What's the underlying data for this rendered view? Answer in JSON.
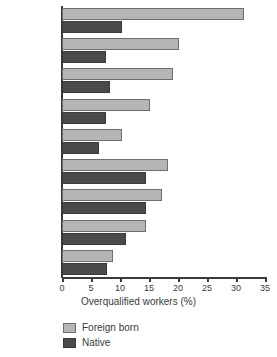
{
  "chart_data": {
    "type": "bar",
    "orientation": "horizontal",
    "title": "",
    "xlabel": "Overqualified workers (%)",
    "ylabel": "",
    "xlim": [
      0,
      35
    ],
    "xticks": [
      0,
      5,
      10,
      15,
      20,
      25,
      30,
      35
    ],
    "xtick_labels": [
      "0",
      "5",
      "10",
      "15",
      "20",
      "25",
      "30",
      "35"
    ],
    "grid": false,
    "legend_position": "bottom-left",
    "categories": [
      "Greece",
      "Spain",
      "Sweden",
      "Italy",
      "Czech Rep.",
      "UK",
      "USA",
      "France",
      "Poland"
    ],
    "series": [
      {
        "name": "Foreign born",
        "color": "#b5b5b5",
        "values": [
          31.4,
          20.1,
          19.2,
          15.2,
          10.4,
          18.2,
          17.2,
          14.4,
          8.8
        ]
      },
      {
        "name": "Native",
        "color": "#4a4a4a",
        "values": [
          10.4,
          7.5,
          8.3,
          7.6,
          6.4,
          14.4,
          14.4,
          11.1,
          7.8
        ]
      }
    ]
  },
  "legend": {
    "items": [
      {
        "label": "Foreign born",
        "key": "foreign"
      },
      {
        "label": "Native",
        "key": "native"
      }
    ]
  },
  "colors": {
    "foreign_born": "#b5b5b5",
    "native": "#4a4a4a",
    "axis": "#3a3a3a",
    "background": "#ffffff"
  }
}
